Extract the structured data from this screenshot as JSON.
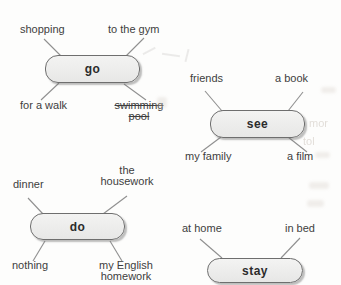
{
  "canvas": {
    "background": "#fdfdfc"
  },
  "colors": {
    "pill_fill": "#ececeb",
    "pill_border": "#6e6e6e",
    "connector_line": "#8f8f8f",
    "text": "#3e3e3e"
  },
  "groups": [
    {
      "verb": "go",
      "words": [
        {
          "text": "shopping",
          "position": "top-left",
          "struck": false
        },
        {
          "text": "to the gym",
          "position": "top-right",
          "struck": false
        },
        {
          "text": "for a walk",
          "position": "bottom-left",
          "struck": false
        },
        {
          "text": "swimming pool",
          "position": "bottom-right",
          "struck": true
        }
      ]
    },
    {
      "verb": "see",
      "words": [
        {
          "text": "friends",
          "position": "top-left",
          "struck": false
        },
        {
          "text": "a book",
          "position": "top-right",
          "struck": false
        },
        {
          "text": "my family",
          "position": "bottom-left",
          "struck": false
        },
        {
          "text": "a film",
          "position": "bottom-right",
          "struck": false
        }
      ]
    },
    {
      "verb": "do",
      "words": [
        {
          "text": "dinner",
          "position": "top-left",
          "struck": false
        },
        {
          "text": "the housework",
          "position": "top-right",
          "struck": false
        },
        {
          "text": "nothing",
          "position": "bottom-left",
          "struck": false
        },
        {
          "text": "my English homework",
          "position": "bottom-right",
          "struck": false
        }
      ]
    },
    {
      "verb": "stay",
      "words": [
        {
          "text": "at home",
          "position": "top-left",
          "struck": false
        },
        {
          "text": "in bed",
          "position": "top-right",
          "struck": false
        }
      ]
    }
  ],
  "artifacts": {
    "bleed_texts": [
      "mor",
      "tol"
    ]
  }
}
